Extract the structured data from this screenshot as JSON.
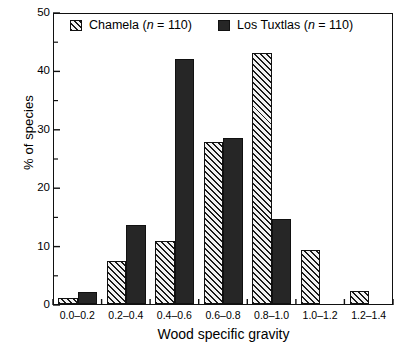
{
  "chart_data": {
    "type": "bar",
    "title": "",
    "xlabel": "Wood specific gravity",
    "ylabel": "% of species",
    "categories": [
      "0.0–0.2",
      "0.2–0.4",
      "0.4–0.6",
      "0.6–0.8",
      "0.8–1.0",
      "1.0–1.2",
      "1.2–1.4"
    ],
    "series": [
      {
        "name": "Chamela (n = 110)",
        "fill": "hatch",
        "values": [
          1.0,
          7.3,
          10.8,
          27.7,
          43.0,
          9.2,
          2.2
        ]
      },
      {
        "name": "Los Tuxtlas (n = 110)",
        "fill": "solid",
        "values": [
          2.0,
          13.5,
          42.0,
          28.5,
          14.5,
          0,
          0
        ]
      }
    ],
    "ylim": [
      0,
      50
    ],
    "yticks": [
      0,
      10,
      20,
      30,
      40,
      50
    ],
    "yticks_minor": [
      5,
      15,
      25,
      35,
      45
    ],
    "grid": false,
    "legend_position": "top-inside"
  },
  "axes": {
    "y_tick_labels": [
      "50",
      "40",
      "30",
      "20",
      "10",
      "0"
    ],
    "y_title": "% of species",
    "x_title": "Wood specific gravity",
    "x_tick_labels": [
      "0.0–0.2",
      "0.2–0.4",
      "0.4–0.6",
      "0.6–0.8",
      "0.8–1.0",
      "1.0–1.2",
      "1.2–1.4"
    ]
  },
  "legend": {
    "chamela": {
      "name": "Chamela",
      "n_prefix": "(",
      "n_symbol": "n",
      "n_value": " = 110)",
      "swatch": "hatched-swatch"
    },
    "tuxtlas": {
      "name": "Los Tuxtlas",
      "n_prefix": "(",
      "n_symbol": "n",
      "n_value": " = 110)",
      "swatch": "solid-swatch"
    }
  },
  "colors": {
    "solid_fill": "#262626",
    "hatch_line": "#1a1a1a",
    "hatch_bg": "#f2f2f2",
    "axis": "#111111"
  }
}
